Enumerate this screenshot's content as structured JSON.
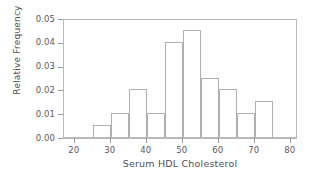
{
  "chart_data": {
    "type": "bar",
    "title": "",
    "xlabel": "Serum HDL Cholesterol",
    "ylabel": "Relative Frequency",
    "xlim": [
      17,
      82
    ],
    "ylim": [
      0.0,
      0.05
    ],
    "grid": false,
    "legend": null,
    "bin_width": 5,
    "bin_edges": [
      25,
      30,
      35,
      40,
      45,
      50,
      55,
      60,
      65,
      70,
      75
    ],
    "categories": [
      "25-30",
      "30-35",
      "35-40",
      "40-45",
      "45-50",
      "50-55",
      "55-60",
      "60-65",
      "65-70",
      "70-75"
    ],
    "values": [
      0.005,
      0.01,
      0.02,
      0.01,
      0.04,
      0.045,
      0.025,
      0.02,
      0.01,
      0.015
    ],
    "xticks": [
      20,
      30,
      40,
      50,
      60,
      70,
      80
    ],
    "xtick_labels": [
      "20",
      "30",
      "40",
      "50",
      "60",
      "70",
      "80"
    ],
    "yticks": [
      0.0,
      0.01,
      0.02,
      0.03,
      0.04,
      0.05
    ],
    "ytick_labels": [
      "0.00",
      "0.01",
      "0.02",
      "0.03",
      "0.04",
      "0.05"
    ],
    "colors": {
      "bar_edge": "#b0b0b0",
      "bar_fill": "#ffffff",
      "frame": "#b9b9b9",
      "text": "#5a5a5a",
      "background": "#ffffff"
    }
  }
}
